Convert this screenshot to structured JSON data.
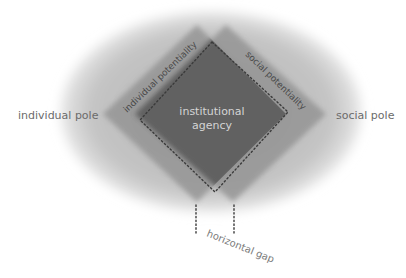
{
  "diagram": {
    "labels": {
      "individual_pole": "individual pole",
      "social_pole": "social pole",
      "individual_potentiality": "individual potentiality",
      "social_potentiality": "social potentiality",
      "institutional_agency_line1": "institutional",
      "institutional_agency_line2": "agency",
      "horizontal_gap": "horizontal gap"
    },
    "colors": {
      "ellipse": "#c8c8c8",
      "left_diamond": "#8c8c8c",
      "right_diamond": "#8c8c8c",
      "overlap": "#5a5a5a",
      "pole_text": "#6b6b6b",
      "potentiality_text": "#4a4a4a",
      "center_text": "#d8d8d8",
      "gap_text": "#7a7a7a",
      "dotted_line": "#3a3a3a"
    }
  }
}
